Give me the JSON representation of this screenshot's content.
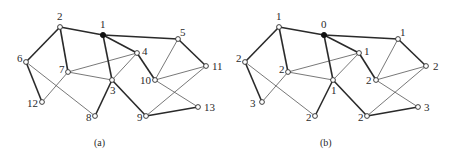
{
  "figure": {
    "colors": {
      "line": "#2a2a2a",
      "thin_line": "#555555",
      "root_fill": "#111111",
      "node_fill": "#ffffff"
    },
    "graphs": [
      {
        "caption": "(a)",
        "caption_pos": [
          94,
          146
        ],
        "nodes": [
          {
            "id": "n1",
            "label": "1",
            "x": 103,
            "y": 35,
            "root": true,
            "lx": 100,
            "ly": 28
          },
          {
            "id": "n2",
            "label": "2",
            "x": 60,
            "y": 27,
            "lx": 57,
            "ly": 20
          },
          {
            "id": "n3",
            "label": "3",
            "x": 112,
            "y": 80,
            "lx": 110,
            "ly": 94
          },
          {
            "id": "n4",
            "label": "4",
            "x": 137,
            "y": 53,
            "lx": 142,
            "ly": 55
          },
          {
            "id": "n5",
            "label": "5",
            "x": 178,
            "y": 39,
            "lx": 180,
            "ly": 36
          },
          {
            "id": "n6",
            "label": "6",
            "x": 26,
            "y": 62,
            "lx": 17,
            "ly": 62
          },
          {
            "id": "n7",
            "label": "7",
            "x": 68,
            "y": 72,
            "lx": 59,
            "ly": 73
          },
          {
            "id": "n8",
            "label": "8",
            "x": 95,
            "y": 116,
            "lx": 86,
            "ly": 121
          },
          {
            "id": "n9",
            "label": "9",
            "x": 146,
            "y": 116,
            "lx": 137,
            "ly": 121
          },
          {
            "id": "n10",
            "label": "10",
            "x": 155,
            "y": 80,
            "lx": 140,
            "ly": 84
          },
          {
            "id": "n11",
            "label": "11",
            "x": 206,
            "y": 66,
            "lx": 212,
            "ly": 70
          },
          {
            "id": "n12",
            "label": "12",
            "x": 42,
            "y": 102,
            "lx": 27,
            "ly": 107
          },
          {
            "id": "n13",
            "label": "13",
            "x": 198,
            "y": 107,
            "lx": 204,
            "ly": 111
          }
        ],
        "tree_edges": [
          [
            "n2",
            "n1"
          ],
          [
            "n1",
            "n5"
          ],
          [
            "n1",
            "n4"
          ],
          [
            "n1",
            "n3"
          ],
          [
            "n2",
            "n6"
          ],
          [
            "n2",
            "n7"
          ],
          [
            "n6",
            "n12"
          ],
          [
            "n3",
            "n8"
          ],
          [
            "n3",
            "n9"
          ],
          [
            "n4",
            "n10"
          ],
          [
            "n5",
            "n11"
          ],
          [
            "n9",
            "n13"
          ]
        ],
        "cross_edges": [
          [
            "n7",
            "n4"
          ],
          [
            "n7",
            "n3"
          ],
          [
            "n7",
            "n12"
          ],
          [
            "n6",
            "n8"
          ],
          [
            "n4",
            "n3"
          ],
          [
            "n5",
            "n10"
          ],
          [
            "n10",
            "n11"
          ],
          [
            "n11",
            "n9"
          ],
          [
            "n10",
            "n13"
          ]
        ]
      },
      {
        "caption": "(b)",
        "caption_pos": [
          320,
          146
        ],
        "nodes": [
          {
            "id": "n1",
            "label": "0",
            "x": 324,
            "y": 35,
            "root": true,
            "lx": 321,
            "ly": 28
          },
          {
            "id": "n2",
            "label": "1",
            "x": 279,
            "y": 27,
            "lx": 276,
            "ly": 20
          },
          {
            "id": "n3",
            "label": "1",
            "x": 333,
            "y": 80,
            "lx": 331,
            "ly": 94
          },
          {
            "id": "n4",
            "label": "1",
            "x": 359,
            "y": 53,
            "lx": 364,
            "ly": 55
          },
          {
            "id": "n5",
            "label": "1",
            "x": 398,
            "y": 39,
            "lx": 400,
            "ly": 36
          },
          {
            "id": "n6",
            "label": "2",
            "x": 245,
            "y": 62,
            "lx": 236,
            "ly": 62
          },
          {
            "id": "n7",
            "label": "2",
            "x": 288,
            "y": 72,
            "lx": 279,
            "ly": 73
          },
          {
            "id": "n8",
            "label": "2",
            "x": 315,
            "y": 116,
            "lx": 306,
            "ly": 121
          },
          {
            "id": "n9",
            "label": "2",
            "x": 367,
            "y": 116,
            "lx": 358,
            "ly": 121
          },
          {
            "id": "n10",
            "label": "2",
            "x": 376,
            "y": 80,
            "lx": 366,
            "ly": 84
          },
          {
            "id": "n11",
            "label": "2",
            "x": 426,
            "y": 66,
            "lx": 433,
            "ly": 70
          },
          {
            "id": "n12",
            "label": "3",
            "x": 262,
            "y": 102,
            "lx": 250,
            "ly": 107
          },
          {
            "id": "n13",
            "label": "3",
            "x": 418,
            "y": 107,
            "lx": 424,
            "ly": 111
          }
        ],
        "tree_edges": [
          [
            "n2",
            "n1"
          ],
          [
            "n1",
            "n5"
          ],
          [
            "n1",
            "n4"
          ],
          [
            "n1",
            "n3"
          ],
          [
            "n2",
            "n6"
          ],
          [
            "n2",
            "n7"
          ],
          [
            "n6",
            "n12"
          ],
          [
            "n3",
            "n8"
          ],
          [
            "n3",
            "n9"
          ],
          [
            "n4",
            "n10"
          ],
          [
            "n5",
            "n11"
          ],
          [
            "n9",
            "n13"
          ]
        ],
        "cross_edges": [
          [
            "n7",
            "n4"
          ],
          [
            "n7",
            "n3"
          ],
          [
            "n7",
            "n12"
          ],
          [
            "n6",
            "n8"
          ],
          [
            "n4",
            "n3"
          ],
          [
            "n5",
            "n10"
          ],
          [
            "n10",
            "n11"
          ],
          [
            "n11",
            "n9"
          ],
          [
            "n10",
            "n13"
          ]
        ]
      }
    ]
  }
}
